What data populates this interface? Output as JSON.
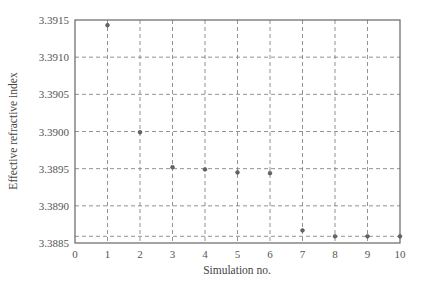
{
  "chart_data": {
    "type": "scatter",
    "title": "",
    "xlabel": "Simulation no.",
    "ylabel": "Effective refractive index",
    "xlim": [
      0,
      10
    ],
    "ylim": [
      3.3885,
      3.3915
    ],
    "x_ticks": [
      0,
      1,
      2,
      3,
      4,
      5,
      6,
      7,
      8,
      9,
      10
    ],
    "x_tick_labels": [
      "0",
      "1",
      "2",
      "3",
      "4",
      "5",
      "6",
      "7",
      "8",
      "9",
      "10"
    ],
    "y_ticks": [
      3.3885,
      3.389,
      3.3895,
      3.39,
      3.3905,
      3.391,
      3.3915
    ],
    "y_tick_labels": [
      "3.3885",
      "3.3890",
      "3.3895",
      "3.3900",
      "3.3905",
      "3.3910",
      "3.3915"
    ],
    "grid": true,
    "extra_horizontal_line": 3.38859,
    "legend": null,
    "series": [
      {
        "name": "Effective refractive index",
        "marker": "circle",
        "color": "#666666",
        "x": [
          1,
          2,
          3,
          4,
          5,
          6,
          7,
          8,
          9,
          10
        ],
        "values": [
          3.39143,
          3.38999,
          3.38952,
          3.38949,
          3.38945,
          3.38944,
          3.38867,
          3.38859,
          3.38859,
          3.38859
        ]
      }
    ]
  },
  "colors": {
    "axis": "#666666",
    "grid": "#777777",
    "marker": "#666666"
  }
}
